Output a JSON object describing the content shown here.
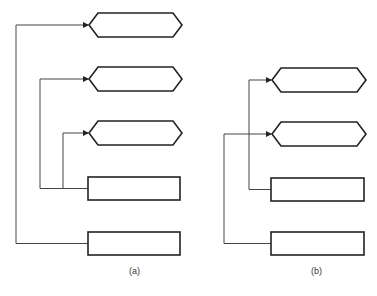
{
  "diagram": {
    "type": "flow-connector-diagram",
    "panels": [
      {
        "label": "(a)",
        "label_pos": [
          133,
          273
        ],
        "hexagons": [
          {
            "x": 89,
            "y": 13,
            "w": 93,
            "h": 24
          },
          {
            "x": 89,
            "y": 67,
            "w": 93,
            "h": 24
          },
          {
            "x": 89,
            "y": 121,
            "w": 93,
            "h": 24
          }
        ],
        "rects": [
          {
            "x": 88,
            "y": 177,
            "w": 92,
            "h": 23
          },
          {
            "x": 88,
            "y": 232,
            "w": 92,
            "h": 23
          }
        ],
        "connectors": [
          {
            "from_rect": 1,
            "to_hex": 0,
            "trunk_x": 16
          },
          {
            "from_rect": 0,
            "to_hex": 1,
            "trunk_x": 40
          },
          {
            "from_rect": 0,
            "to_hex": 2,
            "trunk_x": 63
          }
        ]
      },
      {
        "label": "(b)",
        "label_pos": [
          316,
          273
        ],
        "hexagons": [
          {
            "x": 272,
            "y": 68,
            "w": 94,
            "h": 24
          },
          {
            "x": 272,
            "y": 122,
            "w": 94,
            "h": 24
          }
        ],
        "rects": [
          {
            "x": 271,
            "y": 178,
            "w": 93,
            "h": 23
          },
          {
            "x": 271,
            "y": 232,
            "w": 93,
            "h": 23
          }
        ],
        "connectors": [
          {
            "from_rect": 0,
            "to_hex": 0,
            "trunk_x": 249
          },
          {
            "from_rect": 1,
            "to_hex": 1,
            "trunk_x": 224
          }
        ]
      }
    ],
    "colors": {
      "stroke": "#222222",
      "line": "#444444",
      "background": "#ffffff"
    }
  }
}
